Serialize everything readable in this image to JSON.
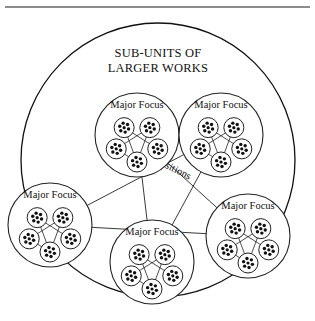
{
  "figure": {
    "title_line1": "SUB-UNITS OF",
    "title_line2": "LARGER WORKS",
    "connector_label": "transitions",
    "colors": {
      "line": "#222222",
      "dot": "#111111",
      "background": "#ffffff",
      "rule": "#555555"
    },
    "outer_circle": {
      "cx": 158,
      "cy": 160,
      "r": 137
    },
    "focus_groups": [
      {
        "id": "top-left",
        "label": "Major Focus",
        "cx": 137,
        "cy": 135,
        "r": 42
      },
      {
        "id": "top-right",
        "label": "Major Focus",
        "cx": 221,
        "cy": 135,
        "r": 42
      },
      {
        "id": "left",
        "label": "Major Focus",
        "cx": 50,
        "cy": 225,
        "r": 42
      },
      {
        "id": "bottom",
        "label": "Major Focus",
        "cx": 152,
        "cy": 262,
        "r": 42
      },
      {
        "id": "right",
        "label": "Major Focus",
        "cx": 248,
        "cy": 236,
        "r": 42
      }
    ],
    "sub_units_per_focus": 5,
    "dots_per_sub_unit": 7
  }
}
